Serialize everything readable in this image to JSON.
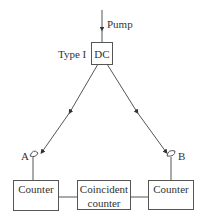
{
  "diagram": {
    "pump_label": "Pump",
    "source_type_label": "Type I",
    "crystal_label": "DC",
    "detector_a_label": "A",
    "detector_b_label": "B",
    "counter_left": {
      "label": "Counter"
    },
    "coincident_counter": {
      "line1": "Coincident",
      "line2": "counter"
    },
    "counter_right": {
      "label": "Counter"
    },
    "caption_partial": "(caption text cut off)",
    "colors": {
      "line": "#555555",
      "text": "#333333",
      "background": "#ffffff"
    }
  }
}
